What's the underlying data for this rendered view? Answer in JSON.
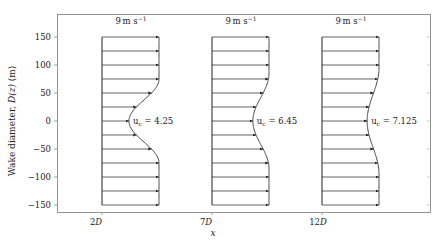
{
  "chart_data": {
    "type": "line",
    "title": "",
    "xlabel": "x",
    "ylabel": "Wake diameter, D(z) (m)",
    "ylim": [
      -160,
      160
    ],
    "yticks": [
      150,
      100,
      50,
      0,
      -50,
      -100,
      -150
    ],
    "xtick_labels": [
      "2D",
      "7D",
      "12D"
    ],
    "grid": false,
    "free_stream_label": "9 m s⁻¹",
    "free_stream_speed": 9,
    "arrow_positions_m": [
      -150,
      -125,
      -100,
      -75,
      -50,
      -25,
      0,
      25,
      50,
      75,
      100,
      125,
      150
    ],
    "series": [
      {
        "name": "2D",
        "u_c": 4.25,
        "annotation": "uₑ = 4.25",
        "deficit_half_width_m": 75
      },
      {
        "name": "7D",
        "u_c": 6.45,
        "annotation": "uₑ = 6.45",
        "deficit_half_width_m": 85
      },
      {
        "name": "12D",
        "u_c": 7.125,
        "annotation": "uₑ = 7.125",
        "deficit_half_width_m": 95
      }
    ]
  },
  "labels": {
    "ylabel_main": "Wake diameter, ",
    "ylabel_var": "D(z)",
    "ylabel_unit": " (m)",
    "xlabel": "x",
    "uc_prefix": "u",
    "uc_sub": "c",
    "speed_num": "9",
    "speed_unit": "m s",
    "speed_exp": "−1",
    "xticks": [
      "2",
      "7",
      "12"
    ],
    "xtick_var": "D",
    "yticks": [
      "150",
      "100",
      "50",
      "0",
      "−50",
      "−100",
      "−150"
    ],
    "uc_values": [
      "= 4.25",
      "= 6.45",
      "= 7.125"
    ]
  }
}
